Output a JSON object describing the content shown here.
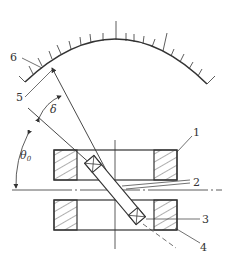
{
  "diagram": {
    "type": "technical-drawing",
    "colors": {
      "line": "#333333",
      "background": "#ffffff"
    },
    "labels": {
      "l1": "1",
      "l2": "2",
      "l3": "3",
      "l4": "4",
      "l5": "5",
      "l6": "6",
      "delta": "δ",
      "theta": "θ",
      "theta_sub": "0"
    },
    "components": [
      {
        "id": "1",
        "name": "upper block"
      },
      {
        "id": "2",
        "name": "reference line"
      },
      {
        "id": "3",
        "name": "roller"
      },
      {
        "id": "4",
        "name": "lower block"
      },
      {
        "id": "5",
        "name": "pointer"
      },
      {
        "id": "6",
        "name": "scale arc"
      }
    ],
    "angles": [
      "δ",
      "θ0"
    ]
  }
}
